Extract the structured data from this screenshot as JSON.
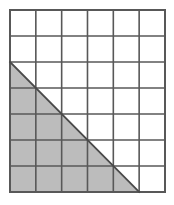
{
  "figure": {
    "background_color": "#ffffff"
  },
  "grid": {
    "columns": 6,
    "rows": 7,
    "origin_x": 10,
    "origin_y": 10,
    "cell_width": 25.83,
    "cell_height": 26.0,
    "width": 155,
    "height": 182,
    "line_color": "#585858",
    "inner_line_width": 1.6,
    "outer_line_width": 2.0,
    "cell_fill_color": "#ffffff"
  },
  "shaded_triangle": {
    "name": "shaded-right-triangle",
    "fill_color": "#bcbcbc",
    "edge_color": "#4a4a4a",
    "edge_width": 1.8,
    "base_cells": 5,
    "height_cells": 5,
    "vertices_cells": [
      {
        "col": 0,
        "row": 2
      },
      {
        "col": 0,
        "row": 7
      },
      {
        "col": 5,
        "row": 7
      }
    ],
    "vertices_px": [
      {
        "x": 10,
        "y": 62
      },
      {
        "x": 10,
        "y": 192
      },
      {
        "x": 139.2,
        "y": 192
      }
    ]
  },
  "shaded_cells": {
    "full_squares": 10,
    "half_squares": 5,
    "description": "Ten fully shaded unit squares plus five half-shaded squares along the hypotenuse"
  }
}
